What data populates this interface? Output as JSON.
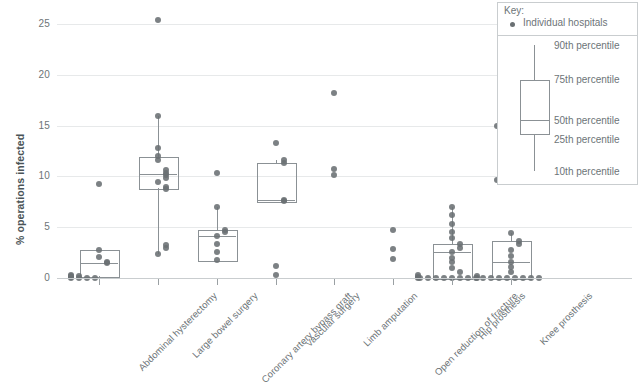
{
  "chart_data": {
    "type": "box",
    "title": "",
    "xlabel": "",
    "ylabel": "% operations infected",
    "ylim": [
      0,
      26.5
    ],
    "yticks": [
      0,
      5,
      10,
      15,
      20,
      25
    ],
    "ytick_labels": [
      "0",
      "5",
      "10",
      "15",
      "20",
      "25"
    ],
    "grid": "horizontal",
    "legend_position": "top-right",
    "categories": [
      "Abdominal hysterectomy",
      "Large bowel surgery",
      "Coronary artery bypass graft",
      "Vascular surgery",
      "Limb amputation",
      "Open reduction of fracture",
      "Hip prosthesis",
      "Knee prosthesis"
    ],
    "series": [
      {
        "name": "Abdominal hysterectomy",
        "box": {
          "p10": 0.0,
          "p25": 0.2,
          "p50": 1.5,
          "p75": 2.8,
          "p90": 2.8
        },
        "points": [
          0.0,
          0.0,
          0.0,
          0.0,
          0.1,
          0.2,
          0.2,
          0.3,
          1.5,
          1.6,
          2.1,
          2.8,
          9.3
        ]
      },
      {
        "name": "Large bowel surgery",
        "box": {
          "p10": 2.4,
          "p25": 8.9,
          "p50": 10.2,
          "p75": 11.9,
          "p90": 15.9
        },
        "points": [
          2.4,
          3.0,
          3.2,
          8.8,
          9.0,
          9.4,
          9.8,
          10.1,
          10.3,
          10.6,
          11.6,
          12.0,
          12.8,
          15.9,
          25.4
        ]
      },
      {
        "name": "Coronary artery bypass graft",
        "box": {
          "p10": 1.8,
          "p25": 1.8,
          "p50": 4.1,
          "p75": 4.7,
          "p90": 7.0
        },
        "points": [
          1.8,
          2.6,
          3.3,
          4.1,
          4.5,
          4.7,
          7.0,
          10.3
        ]
      },
      {
        "name": "Vascular surgery",
        "box": {
          "p10": 7.6,
          "p25": 7.6,
          "p50": 7.7,
          "p75": 11.3,
          "p90": 11.6
        },
        "points": [
          0.3,
          1.2,
          7.6,
          7.7,
          11.3,
          11.6,
          13.3
        ]
      },
      {
        "name": "Limb amputation",
        "box": null,
        "points": [
          10.1,
          10.7,
          18.2
        ]
      },
      {
        "name": "Open reduction of fracture",
        "box": null,
        "points": [
          1.9,
          2.9,
          4.7
        ]
      },
      {
        "name": "Hip prosthesis",
        "box": {
          "p10": 0.0,
          "p25": 0.0,
          "p50": 2.6,
          "p75": 3.3,
          "p90": 7.0
        },
        "points": [
          0.0,
          0.0,
          0.0,
          0.0,
          0.0,
          0.0,
          0.0,
          0.0,
          0.0,
          0.1,
          0.3,
          0.6,
          1.0,
          1.6,
          2.0,
          2.6,
          3.0,
          3.3,
          3.9,
          4.5,
          5.3,
          6.2,
          7.0
        ]
      },
      {
        "name": "Knee prosthesis",
        "box": {
          "p10": 0.0,
          "p25": 0.0,
          "p50": 1.6,
          "p75": 3.6,
          "p90": 4.4
        },
        "points": [
          0.0,
          0.0,
          0.0,
          0.0,
          0.0,
          0.0,
          0.0,
          0.0,
          0.0,
          0.2,
          0.6,
          1.1,
          1.6,
          2.2,
          2.8,
          3.3,
          3.6,
          4.4,
          9.6,
          15.0
        ]
      }
    ]
  },
  "legend": {
    "title": "Key:",
    "dot_label": "Individual hospitals",
    "percentiles": [
      "90th percentile",
      "75th percentile",
      "50th percentile",
      "25th percentile",
      "10th percentile"
    ]
  },
  "colors": {
    "dot": "#6a7073",
    "box_stroke": "#8b9195",
    "grid": "#e7e9ea",
    "text": "#6d7477",
    "background": "#ffffff"
  }
}
